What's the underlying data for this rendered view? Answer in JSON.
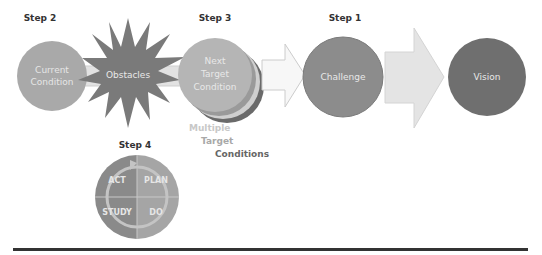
{
  "steps": {
    "step1": "Step 1",
    "step2": "Step 2",
    "step3": "Step 3",
    "step4": "Step 4"
  },
  "nodes": {
    "current_condition": [
      "Current",
      "Condition"
    ],
    "obstacles": "Obstacles",
    "next_target": [
      "Next",
      "Target",
      "Condition"
    ],
    "challenge": "Challenge",
    "vision": "Vision"
  },
  "multiple_targets": [
    "Multiple",
    "Target",
    "Conditions"
  ],
  "pdsa": {
    "act": "ACT",
    "plan": "PLAN",
    "study": "STUDY",
    "do": "DO"
  },
  "colors": {
    "current_condition": "#a9a9a9",
    "obstacles": "#7a7a7a",
    "next_target": "#b5b5b5",
    "challenge": "#8c8c8c",
    "vision": "#6f6f6f",
    "arrow_light": "#e6e6e6",
    "pdsa_dark": "#8a8a8a",
    "pdsa_light": "#a5a5a5",
    "rule": "#333333"
  }
}
